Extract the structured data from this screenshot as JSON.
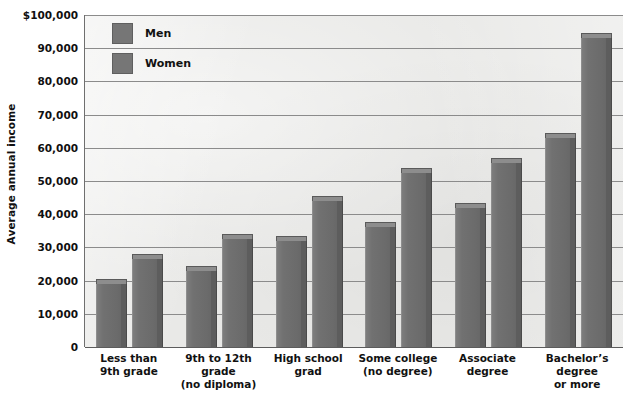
{
  "chart_data": {
    "type": "bar",
    "title": "",
    "xlabel": "",
    "ylabel": "Average annual income",
    "ylim": [
      0,
      100000
    ],
    "grid": true,
    "legend_position": "top-left-inside",
    "categories": [
      "Less than\n9th grade",
      "9th to 12th\ngrade\n(no diploma)",
      "High school\ngrad",
      "Some college\n(no degree)",
      "Associate\ndegree",
      "Bachelor's\ndegree\nor more"
    ],
    "category_lines": [
      [
        "Less than",
        "9th grade"
      ],
      [
        "9th to 12th",
        "grade",
        "(no diploma)"
      ],
      [
        "High school",
        "grad"
      ],
      [
        "Some college",
        "(no degree)"
      ],
      [
        "Associate",
        "degree"
      ],
      [
        "Bachelor’s",
        "degree",
        "or more"
      ]
    ],
    "series": [
      {
        "name": "Men",
        "values": [
          19000,
          23000,
          32000,
          36000,
          42000,
          63000
        ],
        "color": "#6e6e6e"
      },
      {
        "name": "Women",
        "values": [
          26500,
          32500,
          44000,
          52500,
          55500,
          93000
        ],
        "color": "#6e6e6e"
      }
    ],
    "y_ticks": [
      {
        "value": 100000,
        "label": "$100,000"
      },
      {
        "value": 90000,
        "label": "90,000"
      },
      {
        "value": 80000,
        "label": "80,000"
      },
      {
        "value": 70000,
        "label": "70,000"
      },
      {
        "value": 60000,
        "label": "60,000"
      },
      {
        "value": 50000,
        "label": "50,000"
      },
      {
        "value": 40000,
        "label": "40,000"
      },
      {
        "value": 30000,
        "label": "30,000"
      },
      {
        "value": 20000,
        "label": "20,000"
      },
      {
        "value": 10000,
        "label": "10,000"
      },
      {
        "value": 0,
        "label": "0"
      }
    ]
  },
  "legend": {
    "items": [
      {
        "label": "Men",
        "swatch": "legend-swatch-men"
      },
      {
        "label": "Women",
        "swatch": "legend-swatch-women"
      }
    ]
  },
  "axis": {
    "y_title": "Average annual income"
  },
  "colors": {
    "bar_face": "#6e6e6e",
    "bar_top": "#8d8d8d",
    "bar_side": "#5d5d5d",
    "plot_background": "#e9e9e7",
    "gridline": "#8b8b8b",
    "text": "#111111"
  }
}
